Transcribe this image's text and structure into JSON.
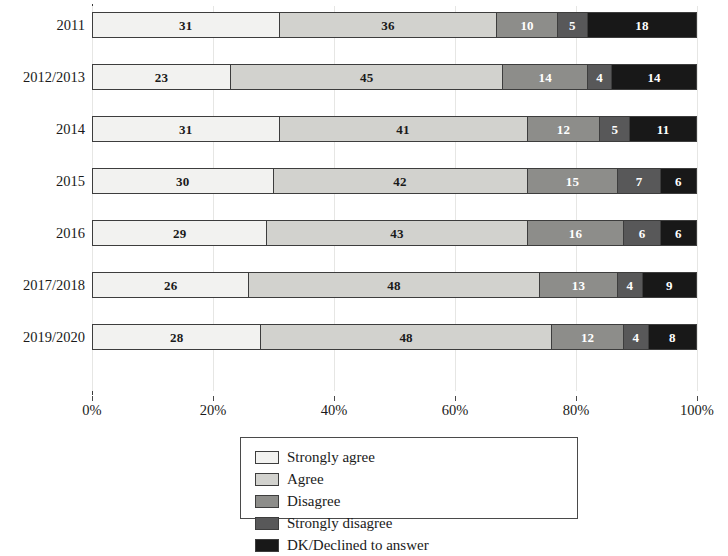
{
  "chart_data": {
    "type": "bar",
    "orientation": "horizontal",
    "stacked": true,
    "normalized_percent": true,
    "title": "",
    "subtitle": "",
    "xlabel": "",
    "ylabel": "",
    "xlim": [
      0,
      100
    ],
    "xticks": [
      "0%",
      "20%",
      "40%",
      "60%",
      "80%",
      "100%"
    ],
    "xtick_values": [
      0,
      20,
      40,
      60,
      80,
      100
    ],
    "grid": "vertical",
    "legend_position": "bottom-center",
    "categories": [
      "2011",
      "2012/2013",
      "2014",
      "2015",
      "2016",
      "2017/2018",
      "2019/2020"
    ],
    "series": [
      {
        "name": "Strongly agree",
        "color": "#f2f2f0",
        "values": [
          31,
          23,
          31,
          30,
          29,
          26,
          28
        ]
      },
      {
        "name": "Agree",
        "color": "#d2d2ce",
        "values": [
          36,
          45,
          41,
          42,
          43,
          48,
          48
        ]
      },
      {
        "name": "Disagree",
        "color": "#8d8d8a",
        "values": [
          10,
          14,
          12,
          15,
          16,
          13,
          12
        ]
      },
      {
        "name": "Strongly disagree",
        "color": "#585859",
        "values": [
          5,
          4,
          5,
          7,
          6,
          4,
          4
        ]
      },
      {
        "name": "DK/Declined to answer",
        "color": "#181818",
        "values": [
          18,
          14,
          11,
          6,
          6,
          9,
          8
        ]
      }
    ],
    "rows": [
      {
        "label": "2011",
        "values": [
          31,
          36,
          10,
          5,
          18
        ]
      },
      {
        "label": "2012/2013",
        "values": [
          23,
          45,
          14,
          4,
          14
        ]
      },
      {
        "label": "2014",
        "values": [
          31,
          41,
          12,
          5,
          11
        ]
      },
      {
        "label": "2015",
        "values": [
          30,
          42,
          15,
          7,
          6
        ]
      },
      {
        "label": "2016",
        "values": [
          29,
          43,
          16,
          6,
          6
        ]
      },
      {
        "label": "2017/2018",
        "values": [
          26,
          48,
          13,
          4,
          9
        ]
      },
      {
        "label": "2019/2020",
        "values": [
          28,
          48,
          12,
          4,
          8
        ]
      }
    ]
  },
  "legend": {
    "items": [
      {
        "label": "Strongly agree",
        "color": "#f2f2f0"
      },
      {
        "label": "Agree",
        "color": "#d2d2ce"
      },
      {
        "label": "Disagree",
        "color": "#8d8d8a"
      },
      {
        "label": "Strongly disagree",
        "color": "#585859"
      },
      {
        "label": "DK/Declined to answer",
        "color": "#181818"
      }
    ]
  },
  "colors": {
    "axis": "#3a3a3a",
    "gridline": "#e6e6e4",
    "segment_border": "#3d3d3d",
    "text": "#1a1a1a",
    "label_light": "#ffffff"
  }
}
